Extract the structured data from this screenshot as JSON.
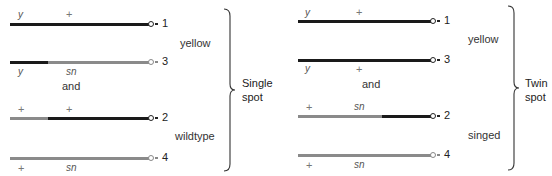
{
  "panels": [
    {
      "name": "single-spot",
      "group_label_line1": "Single",
      "group_label_line2": "spot",
      "top_label": "yellow",
      "connector_top": "and",
      "bottom_label": "wildtype",
      "chromatids": [
        {
          "number": "1",
          "left_allele": "y",
          "right_allele": "+",
          "alleles_pos": "above",
          "left_color": "dark",
          "right_color": "dark"
        },
        {
          "number": "3",
          "left_allele": "y",
          "right_allele": "sn",
          "alleles_pos": "below",
          "left_color": "dark",
          "right_color": "grey"
        },
        {
          "number": "2",
          "left_allele": "+",
          "right_allele": "+",
          "alleles_pos": "above",
          "left_color": "grey",
          "right_color": "dark"
        },
        {
          "number": "4",
          "left_allele": "+",
          "right_allele": "sn",
          "alleles_pos": "below",
          "left_color": "grey",
          "right_color": "grey"
        }
      ]
    },
    {
      "name": "twin-spot",
      "group_label_line1": "Twin",
      "group_label_line2": "spot",
      "top_label": "yellow",
      "connector_top": "and",
      "bottom_label": "singed",
      "chromatids": [
        {
          "number": "1",
          "left_allele": "y",
          "right_allele": "+",
          "alleles_pos": "above",
          "left_color": "dark",
          "right_color": "dark"
        },
        {
          "number": "3",
          "left_allele": "y",
          "right_allele": "+",
          "alleles_pos": "below",
          "left_color": "dark",
          "right_color": "dark"
        },
        {
          "number": "2",
          "left_allele": "+",
          "right_allele": "sn",
          "alleles_pos": "above",
          "left_color": "grey",
          "right_color": "dark"
        },
        {
          "number": "4",
          "left_allele": "+",
          "right_allele": "sn",
          "alleles_pos": "below",
          "left_color": "grey",
          "right_color": "grey"
        }
      ]
    }
  ],
  "colors": {
    "dark": "#1a1a1a",
    "grey": "#8a8a8a"
  }
}
